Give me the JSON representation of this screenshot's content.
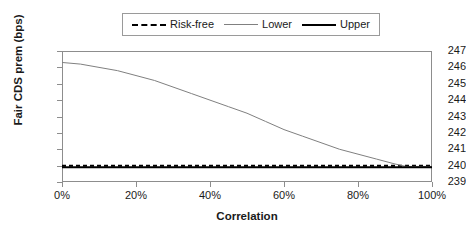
{
  "chart_data": {
    "type": "line",
    "title": "",
    "xlabel": "Correlation",
    "ylabel": "Fair CDS prem (bps)",
    "xlim": [
      0,
      100
    ],
    "ylim": [
      239,
      247
    ],
    "grid": false,
    "legend_position": "top-center",
    "xtick_labels": [
      "0%",
      "20%",
      "40%",
      "60%",
      "80%",
      "100%"
    ],
    "xtick_values": [
      0,
      20,
      40,
      60,
      80,
      100
    ],
    "ytick_labels": [
      "247",
      "246",
      "245",
      "244",
      "243",
      "242",
      "241",
      "240",
      "239"
    ],
    "ytick_values": [
      247,
      246,
      245,
      244,
      243,
      242,
      241,
      240,
      239
    ],
    "x": [
      0,
      5,
      10,
      15,
      20,
      25,
      30,
      35,
      40,
      45,
      50,
      55,
      60,
      65,
      70,
      75,
      80,
      85,
      90,
      93,
      95,
      100
    ],
    "series": [
      {
        "name": "Risk-free",
        "style": "dashed",
        "color": "#000000",
        "width": 2,
        "values": [
          240.0,
          240.0,
          240.0,
          240.0,
          240.0,
          240.0,
          240.0,
          240.0,
          240.0,
          240.0,
          240.0,
          240.0,
          240.0,
          240.0,
          240.0,
          240.0,
          240.0,
          240.0,
          240.0,
          240.0,
          240.0,
          240.0
        ]
      },
      {
        "name": "Lower",
        "style": "solid",
        "color": "#808080",
        "width": 1,
        "values": [
          246.3,
          246.2,
          246.0,
          245.8,
          245.5,
          245.2,
          244.8,
          244.4,
          244.0,
          243.6,
          243.2,
          242.7,
          242.2,
          241.8,
          241.4,
          241.0,
          240.7,
          240.4,
          240.1,
          239.95,
          239.95,
          239.95
        ]
      },
      {
        "name": "Upper",
        "style": "solid",
        "color": "#000000",
        "width": 2,
        "values": [
          239.9,
          239.9,
          239.9,
          239.9,
          239.9,
          239.9,
          239.9,
          239.9,
          239.9,
          239.9,
          239.9,
          239.9,
          239.9,
          239.9,
          239.9,
          239.9,
          239.9,
          239.9,
          239.9,
          239.9,
          239.9,
          239.9
        ]
      }
    ]
  },
  "legend": {
    "entries": [
      {
        "label": "Risk-free",
        "swatch": "dashed-line-swatch"
      },
      {
        "label": "Lower",
        "swatch": "thin-line-swatch"
      },
      {
        "label": "Upper",
        "swatch": "thick-line-swatch"
      }
    ]
  },
  "axes": {
    "y_title": "Fair CDS prem (bps)",
    "x_title": "Correlation"
  }
}
